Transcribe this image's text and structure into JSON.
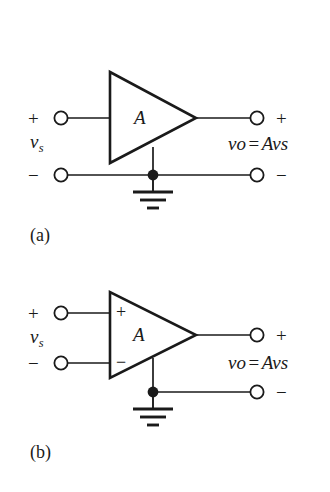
{
  "figure": {
    "background_color": "#ffffff",
    "line_color": "#1a1a1a"
  },
  "panels": [
    {
      "id": "a",
      "caption": "(a)",
      "amplifier": {
        "gain_label": "A",
        "type": "single-ended-triangle",
        "input_markings": []
      },
      "terminals": {
        "input_plus_sign": "+",
        "input_minus_sign": "−",
        "output_plus_sign": "+",
        "output_minus_sign": "−"
      },
      "labels": {
        "source_symbol": "v",
        "source_subscript": "s",
        "output_symbol": "v",
        "output_subscript": "o",
        "equals": "=",
        "gain_term": "A",
        "result_symbol": "v",
        "result_subscript": "s"
      },
      "ground": {
        "symbol": "earth-ground",
        "bars": 3
      },
      "junction_dot": true
    },
    {
      "id": "b",
      "caption": "(b)",
      "amplifier": {
        "gain_label": "A",
        "type": "differential-triangle",
        "input_markings": [
          "+",
          "−"
        ]
      },
      "terminals": {
        "input_plus_sign": "+",
        "input_minus_sign": "−",
        "output_plus_sign": "+",
        "output_minus_sign": "−"
      },
      "labels": {
        "source_symbol": "v",
        "source_subscript": "s",
        "output_symbol": "v",
        "output_subscript": "o",
        "equals": "=",
        "gain_term": "A",
        "result_symbol": "v",
        "result_subscript": "s"
      },
      "ground": {
        "symbol": "earth-ground",
        "bars": 3
      },
      "junction_dot": true
    }
  ]
}
